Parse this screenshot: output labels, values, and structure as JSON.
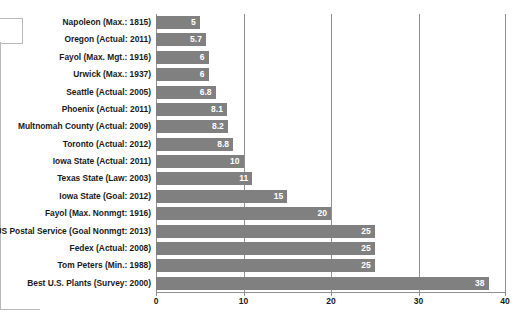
{
  "chart_data": {
    "type": "bar",
    "orientation": "horizontal",
    "title": "",
    "xlabel": "",
    "ylabel": "",
    "xlim": [
      0,
      40
    ],
    "xticks": [
      0,
      10,
      20,
      30,
      40
    ],
    "xtick_labels": [
      "0",
      "10",
      "20",
      "30",
      "40"
    ],
    "grid": true,
    "grid_axis": "x",
    "legend": false,
    "bar_color": "#808080",
    "label_color": "#ffffff",
    "categories": [
      "Napoleon (Max.: 1815)",
      "Oregon (Actual: 2011)",
      "Fayol (Max. Mgt.: 1916)",
      "Urwick (Max.: 1937)",
      "Seattle (Actual: 2005)",
      "Phoenix (Actual: 2011)",
      "Multnomah County (Actual: 2009)",
      "Toronto (Actual: 2012)",
      "Iowa State (Actual: 2011)",
      "Texas State (Law: 2003)",
      "Iowa State (Goal: 2012)",
      "Fayol (Max. Nonmgt: 1916)",
      "US Postal Service (Goal Nonmgt: 2013)",
      "Fedex (Actual: 2008)",
      "Tom Peters (Min.: 1988)",
      "Best U.S. Plants (Survey: 2000)"
    ],
    "values": [
      5,
      5.7,
      6,
      6,
      6.8,
      8.1,
      8.2,
      8.8,
      10,
      11,
      15,
      20,
      25,
      25,
      25,
      38
    ],
    "value_labels": [
      "5",
      "5.7",
      "6",
      "6",
      "6.8",
      "8.1",
      "8.2",
      "8.8",
      "10",
      "11",
      "15",
      "20",
      "25",
      "25",
      "25",
      "38"
    ]
  }
}
